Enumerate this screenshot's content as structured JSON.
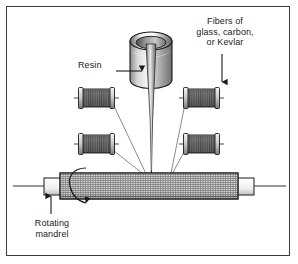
{
  "figure": {
    "background_color": "#ffffff",
    "frame_color": "#3b3b3b"
  },
  "labels": {
    "fibers": "Fibers of\nglass, carbon,\nor Kevlar",
    "resin": "Resin",
    "mandrel": "Rotating\nmandrel"
  },
  "parts": {
    "resin_cup": "resin-cup",
    "resin_stream": "resin-stream",
    "mandrel": "rotating-mandrel",
    "spools": [
      "fiber-spool-upper-left",
      "fiber-spool-lower-left",
      "fiber-spool-upper-right",
      "fiber-spool-lower-right"
    ]
  },
  "colors": {
    "outline": "#1a1a1a",
    "metal_light": "#f2f2f2",
    "metal_mid": "#b8b8b8",
    "metal_dark": "#6e6e6e",
    "spool_thread": "#555555",
    "mandrel_weave": "#9a9a9a",
    "text": "#1a1a1a"
  }
}
